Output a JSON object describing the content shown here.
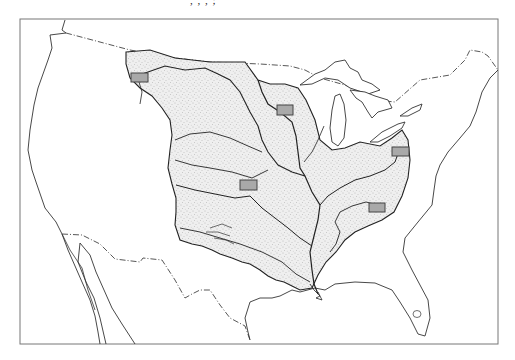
{
  "figure": {
    "type": "map",
    "caption_fragment": ",  ,  ,  ;"
  },
  "colors": {
    "background": "#ffffff",
    "frame": "#777777",
    "coastline": "#333333",
    "border_line": "#444444",
    "basin_fill": "#ececec",
    "stipple": "#8a8a8a",
    "river": "#222222",
    "marker_fill": "#a9a9a9",
    "marker_stroke": "#444444"
  },
  "frame": {
    "x": 20,
    "y": 19,
    "width": 478,
    "height": 325
  },
  "legend": {
    "basin_label": "Mississippi River basin (stippled)",
    "marker_label": "Study site (gray rectangle)",
    "border_label": "International border (dash-dot)"
  },
  "markers": [
    {
      "id": "site-1",
      "region": "Upper Missouri (Montana)",
      "x": 131,
      "y": 73,
      "w": 17,
      "h": 9
    },
    {
      "id": "site-2",
      "region": "Upper Mississippi (Minnesota/Wisconsin)",
      "x": 277,
      "y": 105,
      "w": 16,
      "h": 10
    },
    {
      "id": "site-3",
      "region": "Central Plains (Kansas)",
      "x": 240,
      "y": 180,
      "w": 17,
      "h": 10
    },
    {
      "id": "site-4",
      "region": "Upper Ohio (Pennsylvania/New York)",
      "x": 392,
      "y": 147,
      "w": 17,
      "h": 9
    },
    {
      "id": "site-5",
      "region": "Tennessee Valley (Tennessee/North Carolina)",
      "x": 369,
      "y": 203,
      "w": 16,
      "h": 9
    }
  ]
}
